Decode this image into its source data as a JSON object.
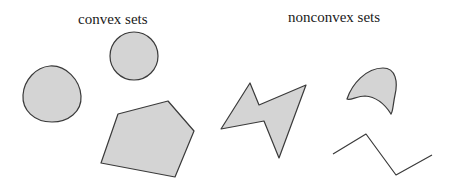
{
  "figure": {
    "labels": {
      "convex": "convex sets",
      "nonconvex": "nonconvex sets"
    },
    "colors": {
      "fill": "#d4d4d4",
      "stroke": "#3a3a3a",
      "background": "#ffffff"
    },
    "groups": [
      {
        "title": "convex sets",
        "shapes": [
          {
            "name": "rounded-blob",
            "kind": "closed-curve",
            "filled": true
          },
          {
            "name": "circle",
            "kind": "circle",
            "filled": true
          },
          {
            "name": "pentagon",
            "kind": "polygon",
            "filled": true
          }
        ]
      },
      {
        "title": "nonconvex sets",
        "shapes": [
          {
            "name": "lightning-bolt",
            "kind": "polygon",
            "filled": true
          },
          {
            "name": "boomerang",
            "kind": "closed-curve",
            "filled": true
          },
          {
            "name": "zigzag-line",
            "kind": "polyline",
            "filled": false
          }
        ]
      }
    ]
  }
}
